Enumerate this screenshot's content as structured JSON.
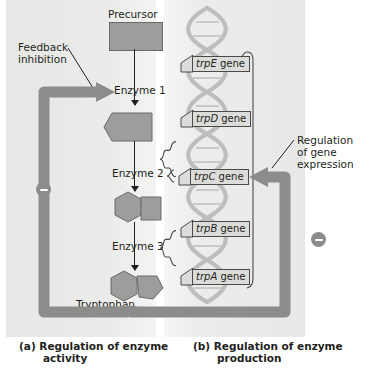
{
  "figure": {
    "panels": [
      {
        "id": "a",
        "caption_prefix": "(a) Regulation of enzyme",
        "caption_suffix": "activity"
      },
      {
        "id": "b",
        "caption_prefix": "(b) Regulation of enzyme",
        "caption_suffix": "production"
      }
    ]
  },
  "labels": {
    "precursor": "Precursor",
    "feedback_line1": "Feedback",
    "feedback_line2": "inhibition",
    "enzyme1": "Enzyme 1",
    "enzyme2": "Enzyme 2",
    "enzyme3": "Enzyme 3",
    "tryptophan": "Tryptophan",
    "regulation_line1": "Regulation",
    "regulation_line2": "of gene",
    "regulation_line3": "expression",
    "minus_sign": "−"
  },
  "genes": [
    {
      "italic": "trpE",
      "rest": " gene"
    },
    {
      "italic": "trpD",
      "rest": " gene"
    },
    {
      "italic": "trpC",
      "rest": " gene"
    },
    {
      "italic": "trpB",
      "rest": " gene"
    },
    {
      "italic": "trpA",
      "rest": " gene"
    }
  ],
  "icons": {
    "dna": "dna-double-helix",
    "minus_left": "minus-circle-icon",
    "minus_right": "minus-circle-icon",
    "feedback_arrow": "feedback-inhibition-arrow",
    "regulation_arrow": "gene-regulation-arrow"
  },
  "colors": {
    "panel_bg": "#e9e9e9",
    "molecule_fill": "#9d9d9c",
    "molecule_stroke": "#6a6a69",
    "pathway": "#8c8c8b",
    "dna": "#b4b4b3",
    "text": "#231f20",
    "gene_tag_bg": "#dcdcda",
    "gene_tag_border": "#4a4a49"
  }
}
